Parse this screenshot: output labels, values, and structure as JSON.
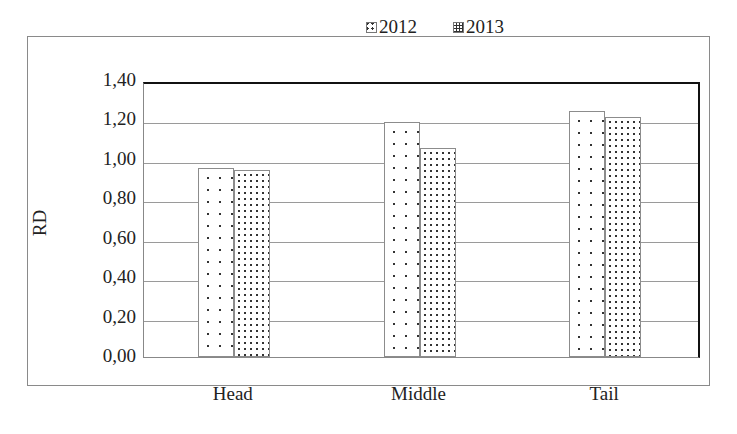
{
  "chart_data": {
    "type": "bar",
    "title": "",
    "xlabel": "",
    "ylabel": "RD",
    "categories": [
      "Head",
      "Middle",
      "Tail"
    ],
    "series": [
      {
        "name": "2012",
        "values": [
          0.96,
          1.19,
          1.25
        ],
        "pattern": "sparse-dots"
      },
      {
        "name": "2013",
        "values": [
          0.95,
          1.06,
          1.22
        ],
        "pattern": "dense-dots"
      }
    ],
    "ylim": [
      0,
      1.4
    ],
    "yticks": [
      "0,00",
      "0,20",
      "0,40",
      "0,60",
      "0,80",
      "1,00",
      "1,20",
      "1,40"
    ],
    "grid": true,
    "legend_position": "top"
  },
  "legend": {
    "items": [
      "2012",
      "2013"
    ]
  },
  "axis": {
    "ylabel": "RD"
  }
}
